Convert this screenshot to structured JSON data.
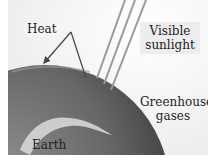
{
  "diagram": {
    "labels": {
      "heat": "Heat",
      "visible_line1": "Visible",
      "visible_line2": "sunlight",
      "greenhouse_line1": "Greenhouse",
      "greenhouse_line2": "gases",
      "earth": "Earth"
    },
    "colors": {
      "earth_dark": "#4a4a4a",
      "earth_mid": "#7a7a7a",
      "cloud": "#d9d9d9",
      "ray": "#8a8a8a",
      "arrow": "#444444",
      "background": "#f2f2f2"
    }
  }
}
